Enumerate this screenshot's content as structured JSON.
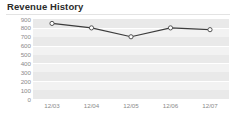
{
  "widget": {
    "title": "Revenue History"
  },
  "chart_data": {
    "type": "line",
    "title": "Revenue History",
    "xlabel": "",
    "ylabel": "",
    "categories": [
      "12/03",
      "12/04",
      "12/05",
      "12/06",
      "12/07"
    ],
    "values": [
      850,
      800,
      700,
      800,
      780
    ],
    "series": [
      {
        "name": "Revenue",
        "values": [
          850,
          800,
          700,
          800,
          780
        ]
      }
    ],
    "ylim": [
      0,
      900
    ],
    "yticks": [
      900,
      800,
      700,
      600,
      500,
      400,
      300,
      200,
      100,
      0
    ],
    "ytick_labels": [
      "900",
      "800",
      "700",
      "600",
      "500",
      "400",
      "300",
      "200",
      "100",
      "0"
    ],
    "xtick_labels": [
      "12/03",
      "12/04",
      "12/05",
      "12/06",
      "12/07"
    ],
    "grid": true,
    "legend": false,
    "legend_position": "none",
    "line_color": "#3c3c3c",
    "marker_fill": "#ffffff",
    "marker_edge": "#555555",
    "plot_background": "#f2f2f2",
    "band_color": "#e9e9e9",
    "gridline_color": "#ffffff",
    "tick_label_color": "#8a8a8a",
    "title_color": "#2b2b2b"
  }
}
